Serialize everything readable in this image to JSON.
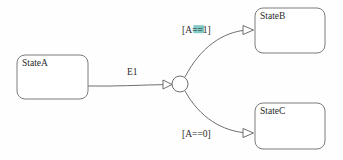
{
  "diagram": {
    "type": "statechart",
    "background_color": "#fefefe",
    "line_color": "#5f5f5f",
    "text_color": "#2a2a2a",
    "highlight_color": "#7fc8c4",
    "states": [
      {
        "id": "stateA",
        "label": "StateA",
        "x": 17,
        "y": 55,
        "width": 71,
        "height": 44,
        "corner_radius": 8,
        "label_x": 22,
        "label_y": 66
      },
      {
        "id": "stateB",
        "label": "StateB",
        "x": 255,
        "y": 8,
        "width": 70,
        "height": 45,
        "corner_radius": 8,
        "label_x": 260,
        "label_y": 19
      },
      {
        "id": "stateC",
        "label": "StateC",
        "x": 255,
        "y": 103,
        "width": 70,
        "height": 46,
        "corner_radius": 8,
        "label_x": 260,
        "label_y": 114
      }
    ],
    "junction": {
      "id": "junction-node",
      "cx": 180,
      "cy": 84,
      "r": 8
    },
    "transitions": [
      {
        "id": "t-a-junction",
        "from": "stateA",
        "to": "junction",
        "label": "E1",
        "label_x": 127,
        "label_y": 75,
        "highlighted": false,
        "path": "M 88 86 C 115 86.5 140 85 168 84.5"
      },
      {
        "id": "t-junction-b",
        "from": "junction",
        "to": "stateB",
        "label": "[A==1]",
        "label_x": 182,
        "label_y": 33,
        "highlighted": true,
        "highlight_segment": "==",
        "path": "M 185 77 C 200 48 222 32 247 30"
      },
      {
        "id": "t-junction-c",
        "from": "junction",
        "to": "stateC",
        "label": "[A==0]",
        "label_x": 182,
        "label_y": 137,
        "highlighted": false,
        "path": "M 185 91 C 200 118 222 131 247 133"
      }
    ]
  }
}
